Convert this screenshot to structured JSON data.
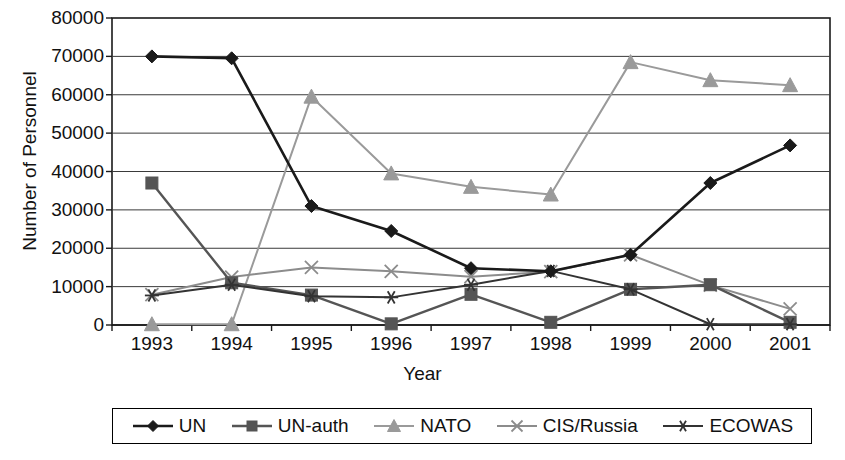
{
  "chart_data": {
    "type": "line",
    "title": "",
    "xlabel": "Year",
    "ylabel": "Number of Personnel",
    "categories": [
      "1993",
      "1994",
      "1995",
      "1996",
      "1997",
      "1998",
      "1999",
      "2000",
      "2001"
    ],
    "x": [
      1993,
      1994,
      1995,
      1996,
      1997,
      1998,
      1999,
      2000,
      2001
    ],
    "ylim": [
      0,
      80000
    ],
    "yticks": [
      0,
      10000,
      20000,
      30000,
      40000,
      50000,
      60000,
      70000,
      80000
    ],
    "ytick_labels": [
      "0",
      "10000",
      "20000",
      "30000",
      "40000",
      "50000",
      "60000",
      "70000",
      "80000"
    ],
    "grid": true,
    "legend_position": "bottom",
    "series": [
      {
        "name": "UN",
        "marker": "diamond",
        "color": "#1a1a1a",
        "values": [
          70000,
          69500,
          31000,
          24500,
          14800,
          14000,
          18300,
          37000,
          46800
        ]
      },
      {
        "name": "UN-auth",
        "marker": "square",
        "color": "#555555",
        "values": [
          37000,
          11000,
          7800,
          300,
          8000,
          700,
          9300,
          10500,
          700
        ]
      },
      {
        "name": "NATO",
        "marker": "triangle",
        "color": "#9a9a9a",
        "values": [
          200,
          200,
          59500,
          39500,
          36000,
          34000,
          68500,
          63800,
          62500
        ]
      },
      {
        "name": "CIS/Russia",
        "marker": "x",
        "color": "#8c8c8c",
        "values": [
          7900,
          12500,
          15000,
          14000,
          12600,
          13900,
          18300,
          10400,
          4200
        ]
      },
      {
        "name": "ECOWAS",
        "marker": "asterisk",
        "color": "#333333",
        "values": [
          7700,
          10500,
          7500,
          7200,
          10500,
          14100,
          9300,
          200,
          200
        ]
      }
    ]
  },
  "legend": {
    "items": [
      {
        "label": "UN",
        "marker": "diamond"
      },
      {
        "label": "UN-auth",
        "marker": "square"
      },
      {
        "label": "NATO",
        "marker": "triangle"
      },
      {
        "label": "CIS/Russia",
        "marker": "x"
      },
      {
        "label": "ECOWAS",
        "marker": "asterisk"
      }
    ]
  }
}
